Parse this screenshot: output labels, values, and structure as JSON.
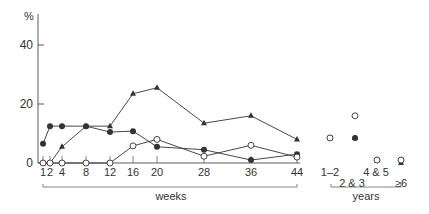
{
  "chart_data": {
    "type": "line",
    "title": "",
    "ylabel": "%",
    "xlabel": "weeks",
    "xlabel_secondary": "years",
    "ylim": [
      0,
      45
    ],
    "yticks": [
      0,
      20,
      40
    ],
    "grid": false,
    "legend": null,
    "x": [
      1,
      2,
      4,
      8,
      12,
      16,
      20,
      28,
      36,
      44
    ],
    "x_tick_labels": [
      "1",
      "2",
      "4",
      "8",
      "12",
      "16",
      "20",
      "28",
      "36",
      "44"
    ],
    "years_categories": [
      "1–2",
      "2 & 3",
      "4 & 5",
      "≥6"
    ],
    "series": [
      {
        "name": "filled-circle",
        "marker": "filled-circle",
        "values": [
          6.5,
          12.5,
          12.5,
          12.5,
          10.5,
          10.8,
          5.5,
          4.5,
          1,
          3
        ],
        "years_values": [
          8.5,
          8.5,
          1,
          1
        ]
      },
      {
        "name": "triangle",
        "marker": "filled-triangle",
        "values": [
          0,
          0,
          5.5,
          12.5,
          12.5,
          23.5,
          25.5,
          13.5,
          16,
          8
        ],
        "years_values": [
          8.5,
          8.5,
          1,
          0
        ]
      },
      {
        "name": "open-circle",
        "marker": "open-circle",
        "values": [
          0,
          0,
          0,
          0,
          0,
          5.8,
          8,
          2.3,
          6,
          2
        ],
        "years_values": [
          8.5,
          16,
          1,
          1
        ]
      }
    ]
  },
  "axis": {
    "y_unit": "%",
    "y_tick_labels": [
      "0",
      "20",
      "40"
    ]
  },
  "labels": {
    "weeks": "weeks",
    "years": "years"
  }
}
